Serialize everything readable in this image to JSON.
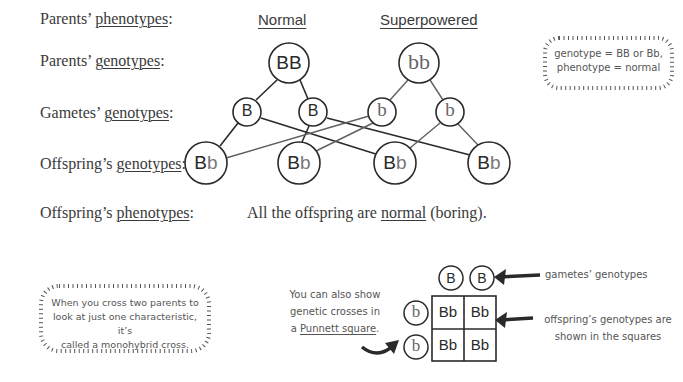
{
  "rows": {
    "parents_phenotypes": {
      "prefix": "Parents’ ",
      "term": "phenotypes",
      "suffix": ":"
    },
    "parents_genotypes": {
      "prefix": "Parents’ ",
      "term": "genotypes",
      "suffix": ":"
    },
    "gametes_genotypes": {
      "prefix": "Gametes’ ",
      "term": "genotypes",
      "suffix": ":"
    },
    "offspring_genotypes": {
      "prefix": "Offspring’s ",
      "term": "genotypes",
      "suffix": ":"
    },
    "offspring_phenotypes": {
      "prefix": "Offspring’s ",
      "term": "phenotypes",
      "suffix": ":"
    }
  },
  "parents": {
    "left": {
      "phenotype": "Normal",
      "genotype": "BB"
    },
    "right": {
      "phenotype": "Superpowered",
      "genotype": "bb"
    }
  },
  "gametes": [
    "B",
    "B",
    "b",
    "b"
  ],
  "offspring": [
    {
      "dominant": "B",
      "recessive": "b"
    },
    {
      "dominant": "B",
      "recessive": "b"
    },
    {
      "dominant": "B",
      "recessive": "b"
    },
    {
      "dominant": "B",
      "recessive": "b"
    }
  ],
  "result": {
    "prefix": "All the offspring are ",
    "term": "normal",
    "suffix": " (boring)."
  },
  "tip_box": {
    "line1": "genotype = BB or Bb,",
    "line2": "phenotype = normal"
  },
  "monohybrid_box": {
    "line1": "When you cross two parents to",
    "line2": "look at just one characteristic, it’s",
    "line3": "called a monohybrid cross."
  },
  "punnett_intro": {
    "line1": "You can also show",
    "line2": "genetic crosses in",
    "line3_prefix": "a ",
    "line3_term": "Punnett square",
    "line3_suffix": "."
  },
  "punnett": {
    "top_gametes": [
      "B",
      "B"
    ],
    "side_gametes": [
      "b",
      "b"
    ],
    "cells": [
      [
        "Bb",
        "Bb"
      ],
      [
        "Bb",
        "Bb"
      ]
    ]
  },
  "annotations": {
    "gametes": "gametes’ genotypes",
    "offspring_line1": "offspring’s genotypes are",
    "offspring_line2": "shown in the squares"
  },
  "colors": {
    "dark": "#2a2a2a",
    "grey": "#555555",
    "recessive": "#666666"
  }
}
